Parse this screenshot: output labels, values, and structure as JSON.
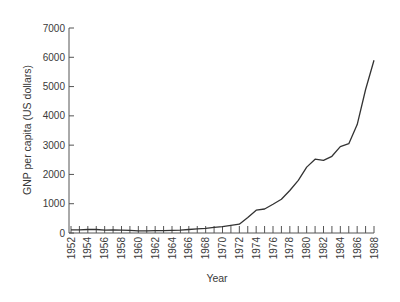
{
  "chart_data": {
    "type": "line",
    "title": "",
    "xlabel": "Year",
    "ylabel": "GNP per capita (US dollars)",
    "ylim": [
      0,
      7000
    ],
    "xlim": [
      1952,
      1988
    ],
    "grid": false,
    "legend": null,
    "y_ticks": [
      0,
      1000,
      2000,
      3000,
      4000,
      5000,
      6000,
      7000
    ],
    "x_tick_labels": [
      "1952",
      "1954",
      "1956",
      "1958",
      "1960",
      "1962",
      "1964",
      "1966",
      "1968",
      "1970",
      "1972",
      "1974",
      "1976",
      "1978",
      "1980",
      "1982",
      "1984",
      "1986",
      "1988"
    ],
    "series": [
      {
        "name": "GNP per capita",
        "x": [
          1952,
          1953,
          1954,
          1955,
          1956,
          1957,
          1958,
          1959,
          1960,
          1961,
          1962,
          1963,
          1964,
          1965,
          1966,
          1967,
          1968,
          1969,
          1970,
          1971,
          1972,
          1973,
          1974,
          1975,
          1976,
          1977,
          1978,
          1979,
          1980,
          1981,
          1982,
          1983,
          1984,
          1985,
          1986,
          1987,
          1988
        ],
        "values": [
          110,
          110,
          120,
          120,
          100,
          110,
          100,
          90,
          70,
          70,
          80,
          80,
          90,
          100,
          120,
          140,
          160,
          190,
          220,
          260,
          300,
          530,
          780,
          820,
          980,
          1150,
          1450,
          1800,
          2250,
          2520,
          2480,
          2620,
          2950,
          3050,
          3700,
          4900,
          5900
        ]
      }
    ]
  }
}
